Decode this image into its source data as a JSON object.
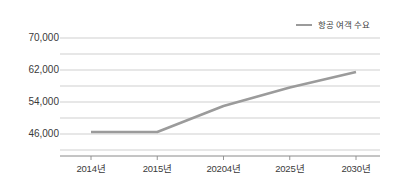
{
  "chart_data": {
    "type": "line",
    "title": "",
    "xlabel": "",
    "ylabel": "",
    "categories": [
      "2014년",
      "2015년",
      "20204년",
      "2025년",
      "2030년"
    ],
    "x_tick_labels": [
      "2014년",
      "2015년",
      "20204년",
      "2025년",
      "2030년"
    ],
    "y_tick_labels": [
      "70,000",
      "62,000",
      "54,000",
      "46,000"
    ],
    "y_tick_values": [
      70000,
      62000,
      54000,
      46000
    ],
    "ylim": [
      42000,
      70000
    ],
    "grid": true,
    "gridlines": [
      70000,
      66000,
      62000,
      58000,
      54000,
      50000,
      46000,
      42000
    ],
    "legend_position": "top-right",
    "series": [
      {
        "name": "항공 여객 수요",
        "color": "#9b9b9b",
        "values": [
          46500,
          46500,
          53000,
          57600,
          61500
        ]
      }
    ]
  },
  "legend": {
    "label": "항공 여객 수요",
    "swatch_color": "#9b9b9b"
  },
  "axis": {
    "line_color": "#8a8a8a",
    "grid_color": "#c9c9c9"
  }
}
